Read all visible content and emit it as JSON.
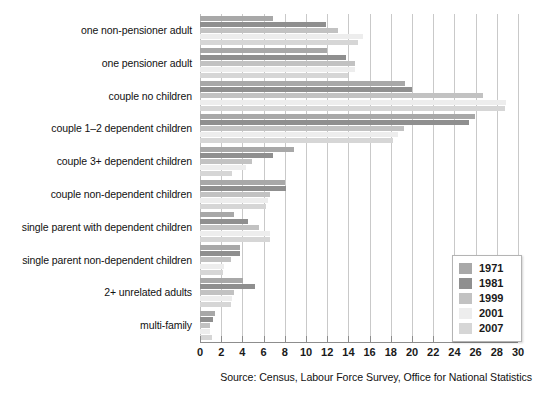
{
  "source_note": "Source: Census, Labour Force Survey, Office for National Statistics",
  "legend": {
    "position": "bottom-right",
    "entries": [
      {
        "label": "1971",
        "color": "#a8a8a8"
      },
      {
        "label": "1981",
        "color": "#8f8f8f"
      },
      {
        "label": "1999",
        "color": "#c2c2c2"
      },
      {
        "label": "2001",
        "color": "#ededed"
      },
      {
        "label": "2007",
        "color": "#d6d6d6"
      }
    ]
  },
  "chart_data": {
    "type": "bar",
    "orientation": "horizontal",
    "title": "",
    "xlabel": "",
    "ylabel": "",
    "xlim": [
      0,
      30
    ],
    "xticks": [
      0,
      2,
      4,
      6,
      8,
      10,
      12,
      14,
      16,
      18,
      20,
      22,
      24,
      26,
      28,
      30
    ],
    "grid": true,
    "categories": [
      "one non-pensioner adult",
      "one pensioner adult",
      "couple no children",
      "couple 1–2 dependent children",
      "couple 3+ dependent children",
      "couple non-dependent children",
      "single parent with dependent children",
      "single parent non-dependent children",
      "2+ unrelated adults",
      "multi-family"
    ],
    "series": [
      {
        "name": "1971",
        "color": "#a8a8a8",
        "values": [
          6.9,
          12.0,
          19.3,
          25.9,
          8.9,
          8.0,
          3.2,
          3.8,
          4.1,
          1.4
        ]
      },
      {
        "name": "1981",
        "color": "#8f8f8f",
        "values": [
          11.9,
          13.8,
          20.0,
          25.4,
          6.9,
          8.1,
          4.5,
          3.8,
          5.2,
          1.2
        ]
      },
      {
        "name": "1999",
        "color": "#c2c2c2",
        "values": [
          13.0,
          14.6,
          26.7,
          19.2,
          4.9,
          6.6,
          5.6,
          2.9,
          3.2,
          0.9
        ]
      },
      {
        "name": "2001",
        "color": "#ededed",
        "values": [
          15.4,
          14.6,
          28.9,
          18.7,
          4.3,
          6.4,
          6.6,
          2.3,
          3.0,
          0.9
        ]
      },
      {
        "name": "2007",
        "color": "#d6d6d6",
        "values": [
          14.9,
          14.0,
          28.8,
          18.2,
          3.0,
          6.2,
          6.6,
          2.2,
          2.9,
          1.1
        ]
      }
    ]
  }
}
